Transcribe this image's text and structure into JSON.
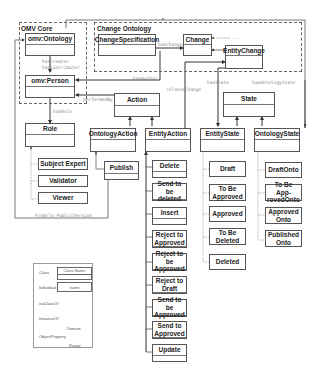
{
  "packages": {
    "omv_core": "OMV Core",
    "change_ontology": "Change Ontology",
    "from_to": "From/To PublicVersion"
  },
  "classes": {
    "omv_ontology": "omv:Ontology",
    "omv_person": "omv:Person",
    "change_specification": "ChangeSpecification",
    "change": "Change",
    "entity_change": "EntityChange",
    "action": "Action",
    "state": "State",
    "role": "Role",
    "ontology_action": "OntologyAction",
    "entity_action": "EntityAction",
    "entity_state": "EntityState",
    "ontology_state": "OntologyState"
  },
  "roles": [
    "Subject Expert",
    "Validator",
    "Viewer"
  ],
  "ontology_actions": [
    "Publish"
  ],
  "entity_actions": [
    "Delete",
    "Send to be deleted",
    "Insert",
    "Reject to Approved",
    "Reject to be Approved",
    "Reject to Draft",
    "Send to be Approved",
    "Send to Approved",
    "Update"
  ],
  "entity_states": [
    "Draft",
    "To Be Approved",
    "Approved",
    "To Be Deleted",
    "Deleted"
  ],
  "ontology_states": [
    "DraftOnto",
    "To Be App-rovedOnto",
    "Approved Onto",
    "Published Onto"
  ],
  "relations": {
    "has_creator": "hasCreator",
    "has_contributor": "hasContributor",
    "has_change": "hasChange",
    "has_author": "hasAuthor",
    "performed_by": "performedBy",
    "has_role": "hasRole",
    "related_change": "relatedChange",
    "has_state": "hasState",
    "has_ontology_state": "hasOntologyState",
    "ellipsis": "..."
  },
  "legend": {
    "class_label": "Class",
    "class_name": "Class Name",
    "individual_label": "Individual",
    "individual_name": "name",
    "subclass_label": "isaClassOf",
    "instance_label": "InstanceOf",
    "object_property_label": "ObjectProperty",
    "domain": "Domain",
    "range": "Range"
  }
}
